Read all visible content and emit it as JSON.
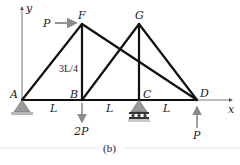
{
  "figure": {
    "caption": "(b)",
    "axes": {
      "x_label": "x",
      "y_label": "y"
    },
    "nodes": {
      "A": "A",
      "B": "B",
      "C": "C",
      "D": "D",
      "F": "F",
      "G": "G"
    },
    "members": [
      "AB",
      "BC",
      "CD",
      "AF",
      "FB",
      "FD",
      "BG",
      "GC",
      "GD"
    ],
    "dimensions": {
      "span_AB": "L",
      "span_BC": "L",
      "span_CD": "L",
      "height": "3L/4"
    },
    "loads": {
      "at_F": "P",
      "at_B": "2P",
      "at_D": "P"
    },
    "supports": {
      "A": "pin",
      "C": "roller"
    },
    "colors": {
      "member": "#111111",
      "load_arrow": "#8a8a8a",
      "support": "#9a9a9a",
      "axis": "#555555"
    }
  }
}
